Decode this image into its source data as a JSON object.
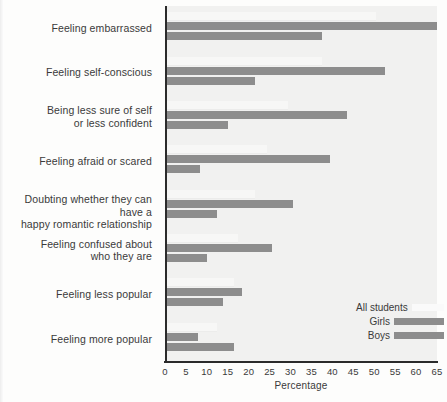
{
  "chart_data": {
    "type": "bar",
    "orientation": "horizontal",
    "title": "",
    "xlabel": "Percentage",
    "ylabel": "",
    "xlim": [
      0,
      65
    ],
    "xticks": [
      0,
      5,
      10,
      15,
      20,
      25,
      30,
      35,
      40,
      45,
      50,
      55,
      60,
      65
    ],
    "grid": false,
    "legend_position": "bottom-right",
    "categories": [
      "Feeling embarrassed",
      "Feeling self-conscious",
      "Being less sure of self or less confident",
      "Feeling afraid or scared",
      "Doubting whether they can have a happy romantic relationship",
      "Feeling confused about who they are",
      "Feeling less popular",
      "Feeling more popular"
    ],
    "series": [
      {
        "name": "All students",
        "color": "#fafafa",
        "values": [
          50,
          37,
          29,
          24,
          21,
          17,
          16,
          12
        ]
      },
      {
        "name": "Girls",
        "color": "#8d8d8d",
        "values": [
          64.5,
          52,
          43,
          39,
          30,
          25,
          18,
          7.5
        ]
      },
      {
        "name": "Boys",
        "color": "#8d8d8d",
        "values": [
          37,
          21,
          14.5,
          8,
          12,
          9.5,
          13.5,
          16
        ]
      }
    ]
  },
  "axis": {
    "x_title": "Percentage",
    "tick_labels": [
      "0",
      "5",
      "10",
      "15",
      "20",
      "25",
      "30",
      "35",
      "40",
      "45",
      "50",
      "55",
      "60",
      "65"
    ]
  },
  "categories_display": [
    {
      "lines": [
        "Feeling embarrassed"
      ]
    },
    {
      "lines": [
        "Feeling self-conscious"
      ]
    },
    {
      "lines": [
        "Being less sure of self",
        "or less confident"
      ]
    },
    {
      "lines": [
        "Feeling afraid or scared"
      ]
    },
    {
      "lines": [
        "Doubting whether they can have a",
        "happy romantic relationship"
      ]
    },
    {
      "lines": [
        "Feeling confused about",
        "who they are"
      ]
    },
    {
      "lines": [
        "Feeling less popular"
      ]
    },
    {
      "lines": [
        "Feeling more popular"
      ]
    }
  ],
  "legend": {
    "entries": [
      {
        "label": "All students",
        "swatch": "all"
      },
      {
        "label": "Girls",
        "swatch": "solid"
      },
      {
        "label": "Boys",
        "swatch": "solid"
      }
    ]
  },
  "colors": {
    "bar": "#8d8d8d",
    "bar_all": "#fafafa",
    "plot_background": "#f1f1f0",
    "axis": "#2b2b2b",
    "text": "#3a3a3a"
  }
}
